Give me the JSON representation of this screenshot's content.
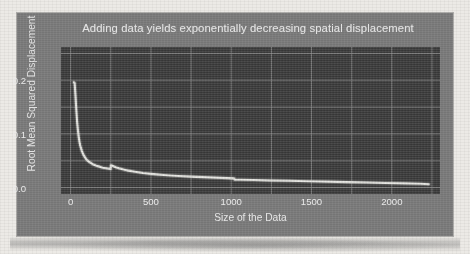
{
  "figure": {
    "background_color": "#7c7c7c",
    "plot_background_color": "#3e3e3e",
    "line_color": "#e8e8e4",
    "grid_color": "#8e8e8e",
    "text_color": "#eaeaea"
  },
  "chart_data": {
    "type": "line",
    "title": "Adding data yields exponentially decreasing spatial displacement",
    "xlabel": "Size of the Data",
    "ylabel": "Root Mean Squared Displacement",
    "xlim": [
      -60,
      2300
    ],
    "ylim": [
      -0.012,
      0.262
    ],
    "xticks": [
      0,
      500,
      1000,
      1500,
      2000
    ],
    "xticklabels": [
      "0",
      "500",
      "1000",
      "1500",
      "2000"
    ],
    "yticks": [
      0.0,
      0.1,
      0.2
    ],
    "yticklabels": [
      "0.0",
      "0.1",
      "0.2"
    ],
    "grid": true,
    "grid_x": [
      0,
      250,
      500,
      750,
      1000,
      1250,
      1500,
      1750,
      2000,
      2250
    ],
    "grid_y": [
      0.0,
      0.05,
      0.1,
      0.15,
      0.2,
      0.25
    ],
    "legend": null,
    "series": [
      {
        "name": "Root Mean Squared Displacement",
        "x": [
          20,
          25,
          30,
          35,
          40,
          45,
          50,
          55,
          60,
          70,
          80,
          90,
          100,
          110,
          120,
          130,
          140,
          150,
          165,
          180,
          200,
          220,
          240,
          249,
          251,
          260,
          280,
          300,
          330,
          360,
          400,
          450,
          500,
          560,
          620,
          700,
          780,
          860,
          940,
          1010,
          1019,
          1021,
          1060,
          1140,
          1240,
          1360,
          1480,
          1600,
          1720,
          1840,
          1960,
          2080,
          2180,
          2230
        ],
        "y": [
          0.196,
          0.195,
          0.172,
          0.146,
          0.124,
          0.108,
          0.095,
          0.085,
          0.078,
          0.068,
          0.061,
          0.056,
          0.052,
          0.049,
          0.047,
          0.045,
          0.043,
          0.042,
          0.04,
          0.039,
          0.037,
          0.036,
          0.035,
          0.0345,
          0.0415,
          0.0405,
          0.038,
          0.036,
          0.0335,
          0.0315,
          0.0295,
          0.0272,
          0.0255,
          0.0238,
          0.0225,
          0.0212,
          0.02,
          0.019,
          0.018,
          0.0172,
          0.017,
          0.0148,
          0.0146,
          0.014,
          0.0133,
          0.0126,
          0.0118,
          0.011,
          0.0102,
          0.0094,
          0.0086,
          0.0078,
          0.007,
          0.0062
        ]
      }
    ],
    "annotations": [
      "sharp exponential decay from ~0.196 near x=25",
      "upward step discontinuity at x approximately 250",
      "downward step discontinuity at x approximately 1020"
    ]
  }
}
